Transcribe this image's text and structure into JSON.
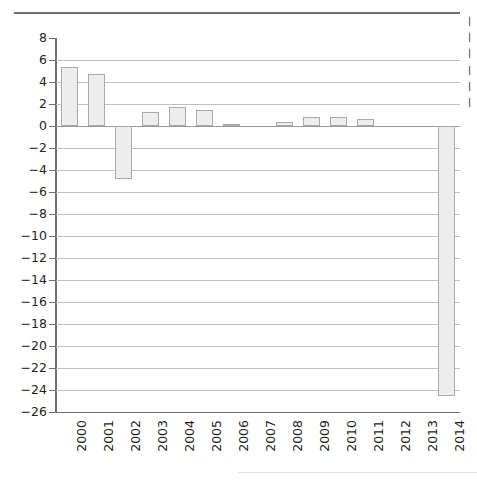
{
  "chart_data": {
    "type": "bar",
    "title": "",
    "subtitle": "",
    "xlabel": "",
    "ylabel": "",
    "categories": [
      "2000",
      "2001",
      "2002",
      "2003",
      "2004",
      "2005",
      "2006",
      "2007",
      "2008",
      "2009",
      "2010",
      "2011",
      "2012",
      "2013",
      "2014"
    ],
    "values": [
      5.4,
      4.7,
      -4.85,
      1.3,
      1.7,
      1.45,
      0.2,
      0,
      0.35,
      0.8,
      0.8,
      0.6,
      0,
      0,
      -24.5
    ],
    "ylim": [
      -26,
      8
    ],
    "ytick_labels": [
      "8",
      "6",
      "4",
      "2",
      "0",
      "−2",
      "−4",
      "−6",
      "−8",
      "−10",
      "−12",
      "−14",
      "−16",
      "−18",
      "−20",
      "−22",
      "−24",
      "−26"
    ],
    "ytick_values": [
      8,
      6,
      4,
      2,
      0,
      -2,
      -4,
      -6,
      -8,
      -10,
      -12,
      -14,
      -16,
      -18,
      -20,
      -22,
      -24,
      -26
    ],
    "grid": true,
    "legend_position": "right",
    "colors": {
      "bar_fill": "#ededed",
      "bar_stroke": "#a9a9a9",
      "gridline": "#bfbfbf",
      "axis": "#6e6e6e",
      "text": "#231f20"
    }
  },
  "legend": {
    "cropped": true,
    "rows": [
      "|",
      "|",
      "|",
      "|",
      "|",
      "|"
    ]
  },
  "decorations": {
    "top_rule": "horizontal-rule",
    "bottom_rule": "horizontal-rule"
  }
}
